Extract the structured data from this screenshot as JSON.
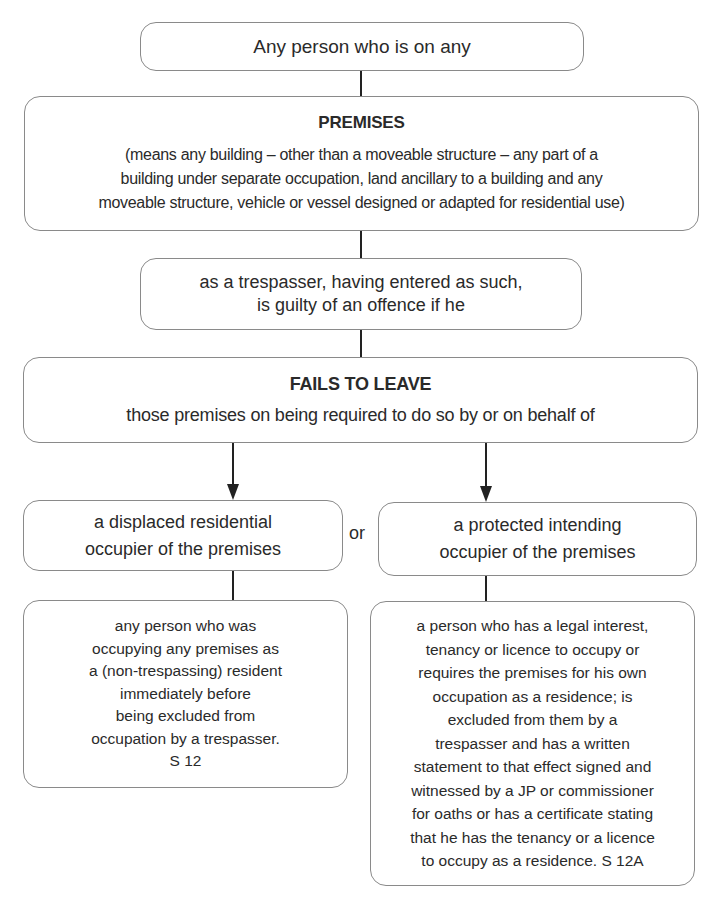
{
  "diagram": {
    "top_box": {
      "text": "Any person who is on any"
    },
    "premises_box": {
      "title": "PREMISES",
      "description_lines": [
        "(means any building – other than a moveable structure – any part of a",
        "building under separate occupation, land ancillary to a building and any",
        "moveable structure, vehicle or vessel designed or adapted for residential use)"
      ]
    },
    "trespasser_box": {
      "lines": [
        "as a trespasser, having entered as such,",
        "is guilty of an offence if he"
      ]
    },
    "fails_box": {
      "title": "FAILS TO LEAVE",
      "description": "those premises on being required to do so by or on behalf of"
    },
    "connector_label": "or",
    "left_branch": {
      "heading_lines": [
        "a displaced residential",
        "occupier of the premises"
      ],
      "description_lines": [
        "any person who was",
        "occupying any premises as",
        "a (non-trespassing) resident",
        "immediately before",
        "being excluded from",
        "occupation by a trespasser.",
        "S 12"
      ]
    },
    "right_branch": {
      "heading_lines": [
        "a protected intending",
        "occupier of the premises"
      ],
      "description_lines": [
        "a person who has a legal interest,",
        "tenancy or licence to occupy or",
        "requires the premises for his own",
        "occupation as a residence; is",
        "excluded from them by a",
        "trespasser and has a written",
        "statement to that effect signed and",
        "witnessed by a JP or commissioner",
        "for oaths or has a certificate stating",
        "that he has the tenancy or a licence",
        "to occupy as a residence. S 12A"
      ]
    },
    "colors": {
      "border": "#8a8a8a",
      "connector": "#222222",
      "text": "#2a2a2a",
      "background": "#ffffff"
    }
  }
}
